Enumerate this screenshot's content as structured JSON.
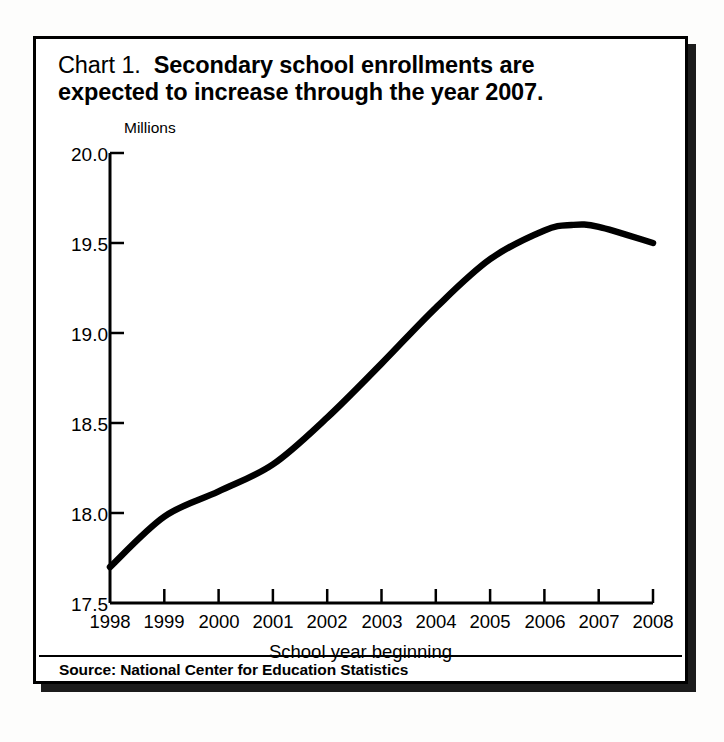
{
  "figure": {
    "title_prefix": "Chart 1.",
    "title_bold_line1": "Secondary school enrollments are",
    "title_bold_line2": "expected to increase through the year 2007.",
    "source": "Source: National Center for Education Statistics",
    "frame_color": "#000000",
    "line_color": "#000000",
    "background": "#ffffff"
  },
  "chart_data": {
    "type": "line",
    "subtitle": "",
    "xlabel": "School year beginning",
    "ylabel": "Millions",
    "unit_label": "Millions",
    "grid": false,
    "legend": null,
    "xlim": [
      1998,
      2008
    ],
    "ylim": [
      17.5,
      20.0
    ],
    "yticks": [
      "17.5",
      "18.0",
      "18.5",
      "19.0",
      "19.5",
      "20.0"
    ],
    "ytick_values": [
      17.5,
      18.0,
      18.5,
      19.0,
      19.5,
      20.0
    ],
    "xticks": [
      "1998",
      "1999",
      "2000",
      "2001",
      "2002",
      "2003",
      "2004",
      "2005",
      "2006",
      "2007",
      "2008"
    ],
    "x": [
      1998,
      1999,
      2000,
      2001,
      2002,
      2003,
      2004,
      2005,
      2006,
      2006.5,
      2007,
      2008
    ],
    "values": [
      17.7,
      17.98,
      18.12,
      18.27,
      18.53,
      18.83,
      19.14,
      19.41,
      19.57,
      19.6,
      19.59,
      19.5
    ],
    "series": [
      {
        "name": "Secondary school enrollment",
        "values": [
          17.7,
          17.98,
          18.12,
          18.27,
          18.53,
          18.83,
          19.14,
          19.41,
          19.57,
          19.6,
          19.59,
          19.5
        ]
      }
    ],
    "annotations": [],
    "source": "Source: National Center for Education Statistics"
  }
}
